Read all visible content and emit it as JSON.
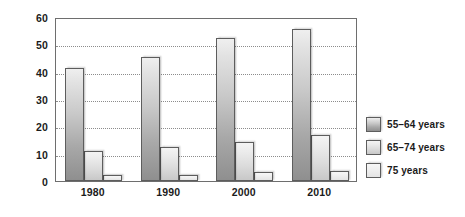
{
  "chart_data": {
    "type": "bar",
    "title": "",
    "subtitle": "",
    "xlabel": "",
    "ylabel": "",
    "categories": [
      "1980",
      "1990",
      "2000",
      "2010"
    ],
    "series": [
      {
        "name": "55–64 years",
        "values": [
          41.5,
          45.5,
          52.3,
          55.5
        ]
      },
      {
        "name": "65–74 years",
        "values": [
          11.0,
          12.3,
          14.3,
          16.8
        ]
      },
      {
        "name": "75 years",
        "values": [
          2.2,
          2.3,
          3.2,
          3.8
        ]
      }
    ],
    "ylim": [
      0,
      60
    ],
    "yticks": [
      0,
      10,
      20,
      30,
      40,
      50,
      60
    ],
    "ytick_labels": [
      "0",
      "10",
      "20",
      "30",
      "40",
      "50",
      "60"
    ],
    "grid": "horizontal-dotted",
    "legend_position": "right",
    "legend_entries": [
      "55–64 years",
      "65–74 years",
      "75 years"
    ],
    "colors": {
      "series_0": "#a8a8a8",
      "series_1": "#dcdcdc",
      "series_2": "#efefef",
      "axis": "#6e6e6e",
      "grid": "#8c8c8c",
      "text": "#1b1b1b",
      "background": "#ffffff"
    }
  }
}
